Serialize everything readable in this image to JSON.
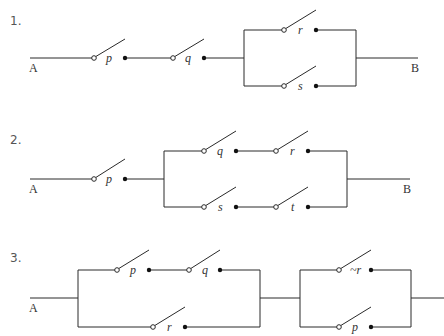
{
  "problems": [
    {
      "number": "1.",
      "start_label": "A",
      "end_label": "B",
      "structure": "series(p, q, parallel(r, s))",
      "switches": [
        {
          "name": "p"
        },
        {
          "name": "q"
        },
        {
          "name": "r"
        },
        {
          "name": "s"
        }
      ]
    },
    {
      "number": "2.",
      "start_label": "A",
      "end_label": "B",
      "structure": "series(p, parallel(series(q, r), series(s, t)))",
      "switches": [
        {
          "name": "p"
        },
        {
          "name": "q"
        },
        {
          "name": "r"
        },
        {
          "name": "s"
        },
        {
          "name": "t"
        }
      ]
    },
    {
      "number": "3.",
      "start_label": "A",
      "structure": "series(parallel(series(p, q), r), parallel(~r, p))",
      "switches": [
        {
          "name": "p"
        },
        {
          "name": "q"
        },
        {
          "name": "r"
        },
        {
          "name": "~r"
        },
        {
          "name": "p"
        }
      ]
    }
  ]
}
